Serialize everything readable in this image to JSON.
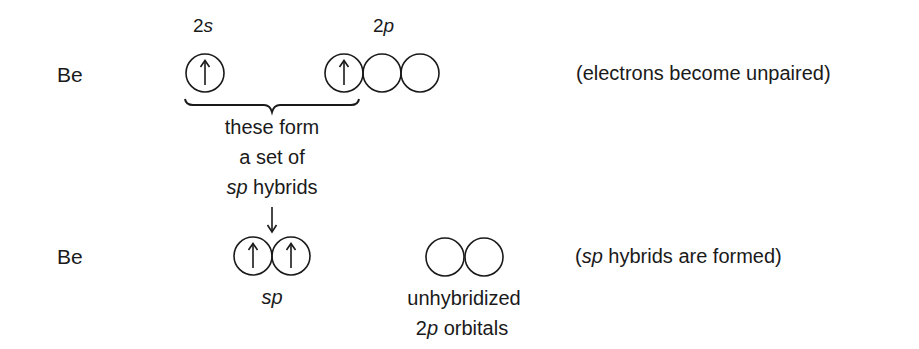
{
  "rows": [
    {
      "element": "Be",
      "orbital_labels": [
        {
          "name": "2s",
          "prefix": "2",
          "suffix": "s"
        },
        {
          "name": "2p",
          "prefix": "2",
          "suffix": "p"
        }
      ],
      "orbitals": {
        "2s": [
          {
            "electron": "up"
          }
        ],
        "2p": [
          {
            "electron": "up"
          },
          {
            "electron": "none"
          },
          {
            "electron": "none"
          }
        ]
      },
      "note": "(electrons become unpaired)"
    },
    {
      "element": "Be",
      "orbitals": {
        "sp": [
          {
            "electron": "up"
          },
          {
            "electron": "up"
          }
        ],
        "unhybridized_2p": [
          {
            "electron": "none"
          },
          {
            "electron": "none"
          }
        ]
      },
      "sp_label": "sp",
      "unhybridized_label_line1": "unhybridized",
      "unhybridized_label_line2_prefix": "2",
      "unhybridized_label_line2_italic": "p",
      "unhybridized_label_line2_suffix": " orbitals",
      "note_open": "(",
      "note_italic": "sp",
      "note_rest": " hybrids are formed)"
    }
  ],
  "brace_caption": {
    "line1": "these form",
    "line2": "a set of",
    "line3_italic": "sp",
    "line3_rest": " hybrids"
  },
  "arrow_glyph": "↑",
  "colors": {
    "ink": "#1a1a1a",
    "background": "#ffffff"
  }
}
